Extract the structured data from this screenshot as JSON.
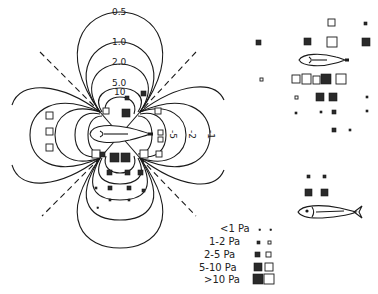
{
  "contour_labels": {
    "top": [
      "0.5",
      "1.0",
      "2.0",
      "5.0",
      "10"
    ],
    "right_negative": [
      "-5",
      "-2",
      "-1"
    ]
  },
  "legend": {
    "items": [
      {
        "label": "<1 Pa"
      },
      {
        "label": "1-2 Pa"
      },
      {
        "label": "2-5 Pa"
      },
      {
        "label": "5-10 Pa"
      },
      {
        "label": ">10 Pa"
      }
    ]
  },
  "colors": {
    "line": "#1a1a1a",
    "filled_marker": "#2a2a2a",
    "background": "#ffffff"
  },
  "icons": {
    "fish_outline_center": "fish-outline",
    "fish_outline_right": "fish-outline",
    "fish_detailed": "fish-drawing"
  }
}
